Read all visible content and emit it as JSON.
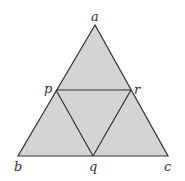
{
  "diagram": {
    "type": "geometric-figure",
    "fill_color": "#d4d4d4",
    "stroke_color": "#333333",
    "vertices": {
      "a": {
        "label": "a",
        "x": 95,
        "y": 25
      },
      "b": {
        "label": "b",
        "x": 18,
        "y": 156
      },
      "c": {
        "label": "c",
        "x": 168,
        "y": 156
      },
      "p": {
        "label": "p",
        "x": 56,
        "y": 90
      },
      "q": {
        "label": "q",
        "x": 93,
        "y": 156
      },
      "r": {
        "label": "r",
        "x": 131,
        "y": 90
      }
    },
    "segments": [
      [
        "a",
        "b"
      ],
      [
        "b",
        "c"
      ],
      [
        "c",
        "a"
      ],
      [
        "p",
        "r"
      ],
      [
        "p",
        "q"
      ],
      [
        "q",
        "r"
      ]
    ],
    "labels": {
      "a": "a",
      "b": "b",
      "c": "c",
      "p": "p",
      "q": "q",
      "r": "r"
    }
  }
}
